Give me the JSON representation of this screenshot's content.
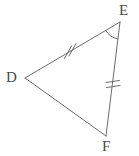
{
  "figure": {
    "kind": "geometry-triangle-diagram",
    "name": "Triangle DEF",
    "background_color": "#ffffff",
    "stroke_color": "#6b6b6b",
    "label_color": "#4a4a4a",
    "stroke_width": 1
  },
  "vertices": [
    {
      "id": "D",
      "label": "D",
      "x": 25,
      "y": 78,
      "label_x": 6,
      "label_y": 70
    },
    {
      "id": "E",
      "label": "E",
      "x": 120,
      "y": 22,
      "label_x": 119,
      "label_y": 3
    },
    {
      "id": "F",
      "label": "F",
      "x": 106,
      "y": 136,
      "label_x": 102,
      "label_y": 139
    }
  ],
  "sides": [
    {
      "id": "DE",
      "from": "D",
      "to": "E",
      "tick_marks": 2,
      "midpoint_x": 72,
      "midpoint_y": 50
    },
    {
      "id": "EF",
      "from": "E",
      "to": "F",
      "tick_marks": 2,
      "midpoint_x": 113,
      "midpoint_y": 79
    },
    {
      "id": "DF",
      "from": "D",
      "to": "F",
      "tick_marks": 0,
      "midpoint_x": 65,
      "midpoint_y": 107
    }
  ],
  "angle_marks": [
    {
      "id": "angle-E",
      "at_vertex": "E",
      "arcs": 1,
      "radius": 17
    }
  ],
  "congruence_notes": {
    "equal_sides": "DE = EF (double tick marks)",
    "marked_angle": "angle at E"
  }
}
